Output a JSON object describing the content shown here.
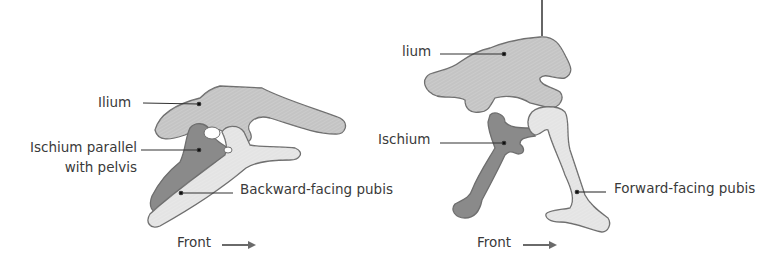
{
  "diagrams": [
    {
      "name": "left-pelvis",
      "labels": {
        "ilium": "Ilium",
        "ischium_line1": "Ischium parallel",
        "ischium_line2": "with pelvis",
        "pubis": "Backward-facing pubis",
        "front": "Front"
      }
    },
    {
      "name": "right-pelvis",
      "labels": {
        "ilium": "lium",
        "ischium": "Ischium",
        "pubis": "Forward-facing pubis",
        "front": "Front"
      }
    }
  ],
  "colors": {
    "ilium": "#c4c4c4",
    "ischium": "#8a8a8a",
    "pubis": "#e4e4e4",
    "outline": "#6e6e6e",
    "text": "#3a3a3a",
    "line": "#333333",
    "arrow": "#6a6a6a"
  }
}
